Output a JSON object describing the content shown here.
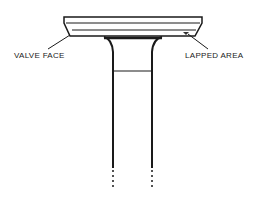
{
  "diagram": {
    "subject": "valve",
    "labels": {
      "valve_face": "VALVE FACE",
      "lapped_area": "LAPPED AREA"
    }
  }
}
